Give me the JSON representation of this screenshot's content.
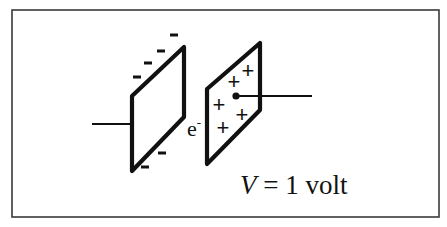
{
  "diagram": {
    "left_plate": {
      "charge_symbol": "-",
      "charge_count": 6,
      "label": "negative plate"
    },
    "right_plate": {
      "charge_symbol": "+",
      "charge_count": 5,
      "label": "positive plate"
    },
    "particle": {
      "symbol": "e",
      "superscript": "-"
    },
    "voltage_label": {
      "variable": "V",
      "equals": " = 1 volt"
    },
    "colors": {
      "ink": "#111111",
      "frame": "#3a3a3a",
      "background": "#ffffff"
    }
  }
}
